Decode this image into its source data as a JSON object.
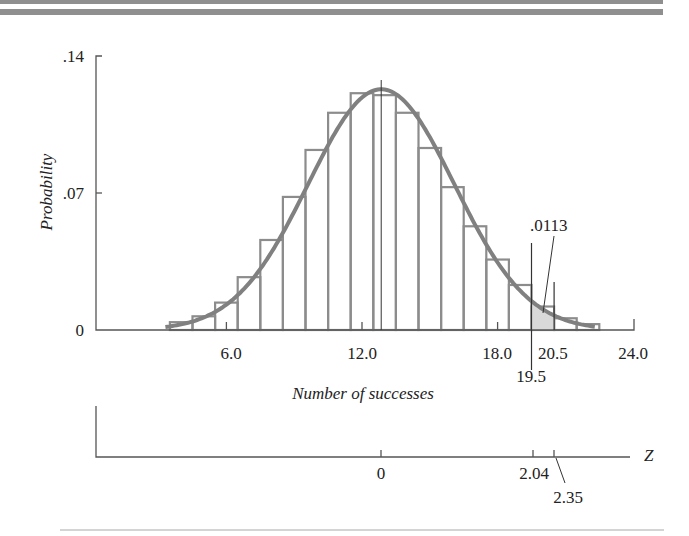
{
  "colors": {
    "bar_stroke": "#8c8c8c",
    "curve": "#808080",
    "axis": "#555555",
    "shade": "#d9d9d9",
    "text": "#222222",
    "rule": "#8f8f8f"
  },
  "chart_data": {
    "type": "bar",
    "title": "",
    "xlabel": "Number of successes",
    "ylabel": "Probability",
    "ylim": [
      0,
      0.14
    ],
    "xlim": [
      0,
      24
    ],
    "y_ticks": [
      {
        "value": 0,
        "label": "0"
      },
      {
        "value": 0.07,
        "label": ".07"
      },
      {
        "value": 0.14,
        "label": ".14"
      }
    ],
    "x_ticks": [
      {
        "value": 6,
        "label": "6.0"
      },
      {
        "value": 12,
        "label": "12.0"
      },
      {
        "value": 18,
        "label": "18.0"
      },
      {
        "value": 24,
        "label": "24.0"
      }
    ],
    "categories": [
      4,
      5,
      6,
      7,
      8,
      9,
      10,
      11,
      12,
      13,
      14,
      15,
      16,
      17,
      18,
      19,
      20,
      21,
      22
    ],
    "series": [
      {
        "name": "Binomial probability",
        "values": [
          0.004,
          0.007,
          0.014,
          0.027,
          0.046,
          0.068,
          0.092,
          0.111,
          0.121,
          0.12,
          0.111,
          0.093,
          0.073,
          0.053,
          0.036,
          0.023,
          0.012,
          0.006,
          0.003
        ]
      }
    ],
    "normal_curve": {
      "mean": 12.85,
      "peak": 0.123,
      "sd": 3.23
    },
    "mean_marker": 12.85,
    "shaded_region": {
      "from": 19.5,
      "to": 20.5,
      "area_label": ".0113"
    },
    "boundary_labels": [
      {
        "value": 19.5,
        "label": "19.5"
      },
      {
        "value": 20.5,
        "label": "20.5"
      }
    ],
    "z_axis": {
      "label": "Z",
      "ticks": [
        {
          "value": 0,
          "label": "0"
        },
        {
          "value": 2.04,
          "label": "2.04"
        },
        {
          "value": 2.35,
          "label": "2.35"
        }
      ]
    },
    "grid": false,
    "legend": "none"
  }
}
